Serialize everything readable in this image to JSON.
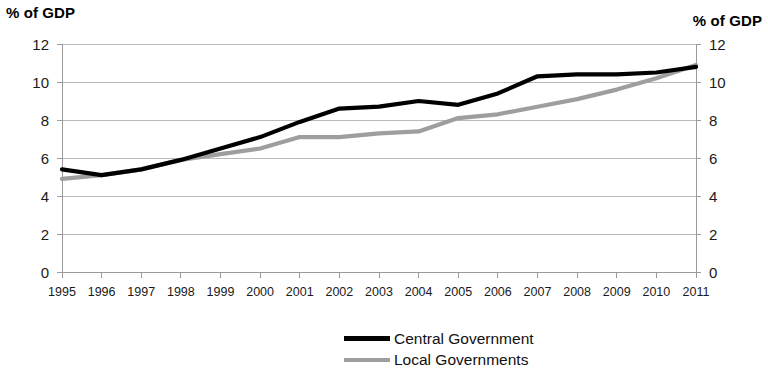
{
  "axis_titles": {
    "left": "% of GDP",
    "right": "% of GDP"
  },
  "legend": {
    "items": [
      {
        "label": "Central Government",
        "color": "#000000"
      },
      {
        "label": "Local Governments",
        "color": "#9e9e9e"
      }
    ]
  },
  "chart_data": {
    "type": "line",
    "title": "",
    "subtitle": "",
    "xlabel": "",
    "ylabel": "% of GDP",
    "ylabel_right": "% of GDP",
    "ylim": [
      0,
      12
    ],
    "yticks": [
      0,
      2,
      4,
      6,
      8,
      10,
      12
    ],
    "ytick_labels": [
      "0",
      "2",
      "4",
      "6",
      "8",
      "10",
      "12"
    ],
    "ytick_labels_right": [
      "0",
      "2",
      "4",
      "6",
      "8",
      "10",
      "12"
    ],
    "grid": true,
    "grid_axis": "y",
    "legend_position": "bottom",
    "categories": [
      "1995",
      "1996",
      "1997",
      "1998",
      "1999",
      "2000",
      "2001",
      "2002",
      "2003",
      "2004",
      "2005",
      "2006",
      "2007",
      "2008",
      "2009",
      "2010",
      "2011"
    ],
    "x": [
      1995,
      1996,
      1997,
      1998,
      1999,
      2000,
      2001,
      2002,
      2003,
      2004,
      2005,
      2006,
      2007,
      2008,
      2009,
      2010,
      2011
    ],
    "series": [
      {
        "name": "Central Government",
        "color": "#000000",
        "line_width": 4.2,
        "values": [
          5.4,
          5.1,
          5.4,
          5.9,
          6.5,
          7.1,
          7.9,
          8.6,
          8.7,
          9.0,
          8.8,
          9.4,
          10.3,
          10.4,
          10.4,
          10.5,
          10.8
        ]
      },
      {
        "name": "Local Governments",
        "color": "#9e9e9e",
        "line_width": 4.2,
        "values": [
          4.9,
          5.1,
          5.4,
          5.9,
          6.2,
          6.5,
          7.1,
          7.1,
          7.3,
          7.4,
          8.1,
          8.3,
          8.7,
          9.1,
          9.6,
          10.2,
          10.9
        ]
      }
    ]
  }
}
